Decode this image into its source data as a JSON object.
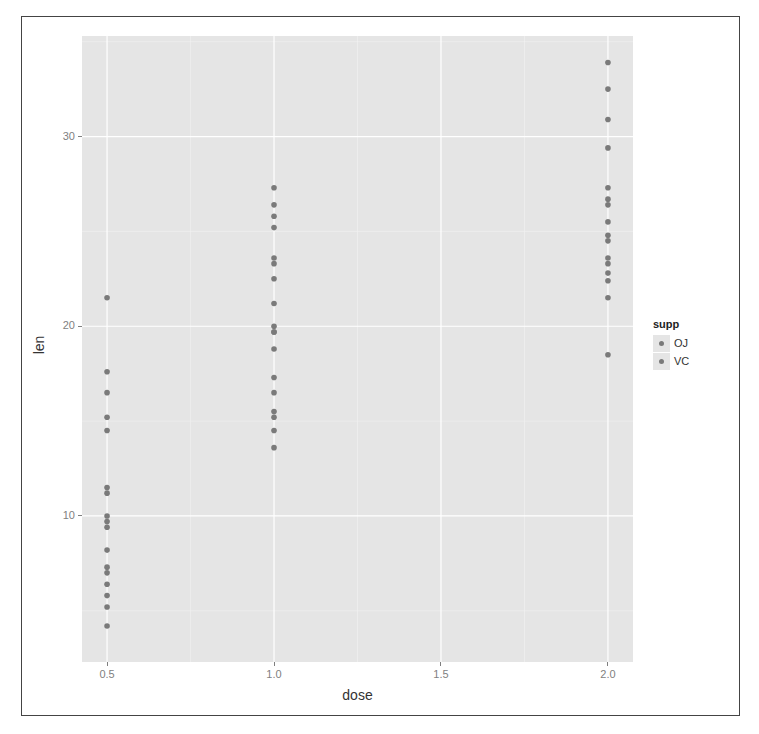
{
  "chart_data": {
    "type": "scatter",
    "title": "",
    "xlabel": "dose",
    "ylabel": "len",
    "x_ticks": [
      0.5,
      1.0,
      1.5,
      2.0
    ],
    "x_tick_labels": [
      "0.5",
      "1.0",
      "1.5",
      "2.0"
    ],
    "y_ticks": [
      10,
      20,
      30
    ],
    "y_tick_labels": [
      "10",
      "20",
      "30"
    ],
    "xlim": [
      0.425,
      2.075
    ],
    "ylim": [
      2.3,
      35.3
    ],
    "grid": true,
    "legend": {
      "title": "supp",
      "position": "right",
      "entries": [
        "OJ",
        "VC"
      ]
    },
    "point_color": "#7a7a7a",
    "panel_background": "#e5e5e5",
    "points": [
      {
        "dose": 0.5,
        "len": [
          21.5,
          17.6,
          16.5,
          15.2,
          14.5,
          11.5,
          11.2,
          10.0,
          9.7,
          9.4,
          8.2,
          7.3,
          7.0,
          6.4,
          5.8,
          5.2,
          4.2
        ]
      },
      {
        "dose": 1.0,
        "len": [
          27.3,
          26.4,
          25.8,
          25.2,
          23.6,
          23.3,
          22.5,
          21.2,
          20.0,
          19.7,
          19.7,
          18.8,
          17.3,
          16.5,
          15.5,
          15.2,
          14.5,
          13.6
        ]
      },
      {
        "dose": 2.0,
        "len": [
          33.9,
          32.5,
          30.9,
          29.4,
          27.3,
          26.7,
          26.4,
          25.5,
          24.8,
          24.5,
          23.6,
          23.3,
          22.8,
          22.4,
          21.5,
          18.5
        ]
      }
    ]
  }
}
